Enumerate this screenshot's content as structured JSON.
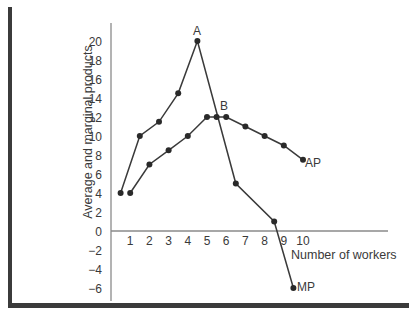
{
  "chart_data": {
    "type": "line",
    "title": "",
    "xlabel": "Number of workers",
    "ylabel": "Average and marginal products",
    "xlim": [
      0,
      11
    ],
    "ylim": [
      -7,
      21
    ],
    "x_ticks": [
      "1",
      "2",
      "3",
      "4",
      "5",
      "6",
      "7",
      "8",
      "9",
      "10"
    ],
    "y_ticks": [
      "20",
      "18",
      "16",
      "14",
      "12",
      "10",
      "8",
      "6",
      "4",
      "2",
      "0",
      "−2",
      "−4",
      "−6"
    ],
    "grid": false,
    "legend": "inline labels at line ends",
    "series": [
      {
        "name": "MP",
        "x": [
          0.5,
          1.5,
          2.5,
          3.5,
          4.5,
          6.5,
          8.5,
          9.5
        ],
        "values": [
          4,
          10,
          11.5,
          14.5,
          20,
          5,
          1,
          -6
        ]
      },
      {
        "name": "AP",
        "x": [
          1,
          2,
          3,
          4,
          5,
          5.5,
          6,
          7,
          8,
          9,
          10
        ],
        "values": [
          4,
          7,
          8.5,
          10,
          12,
          12,
          12,
          11,
          10,
          9,
          7.5
        ]
      }
    ],
    "annotations": [
      {
        "label": "A",
        "x": 4.5,
        "y": 20,
        "note": "peak of MP"
      },
      {
        "label": "B",
        "x": 5.5,
        "y": 12,
        "note": "MP crosses AP at AP maximum"
      }
    ]
  },
  "labels": {
    "ylabel": "Average and marginal products",
    "xlabel": "Number of workers",
    "mp": "MP",
    "ap": "AP",
    "point_a": "A",
    "point_b": "B"
  }
}
